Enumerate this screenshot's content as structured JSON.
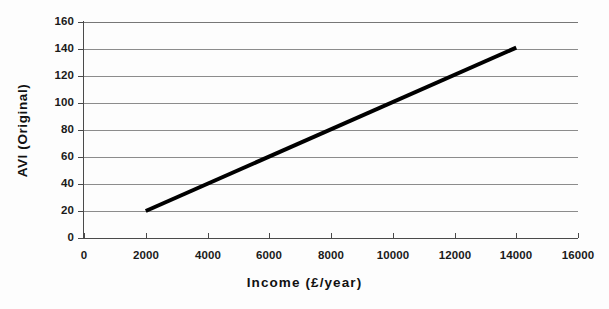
{
  "chart_data": {
    "type": "line",
    "title": "",
    "xlabel": "Income (£/year)",
    "ylabel": "AVI (Original)",
    "xlim": [
      0,
      16000
    ],
    "ylim": [
      0,
      160
    ],
    "xticks": [
      0,
      2000,
      4000,
      6000,
      8000,
      10000,
      12000,
      14000,
      16000
    ],
    "yticks": [
      0,
      20,
      40,
      60,
      80,
      100,
      120,
      140,
      160
    ],
    "xtick_labels": [
      "0",
      "2000",
      "4000",
      "6000",
      "8000",
      "10000",
      "12000",
      "14000",
      "16000"
    ],
    "ytick_labels": [
      "0",
      "20",
      "40",
      "60",
      "80",
      "100",
      "120",
      "140",
      "160"
    ],
    "grid": "horizontal",
    "legend": "none",
    "series": [
      {
        "name": "AVI (Original)",
        "color": "#000000",
        "line_width": 4,
        "x": [
          2000,
          14000
        ],
        "values": [
          20,
          141
        ]
      }
    ],
    "annotations": []
  },
  "axes": {
    "x_title": "Income (£/year)",
    "y_title": "AVI (Original)"
  }
}
